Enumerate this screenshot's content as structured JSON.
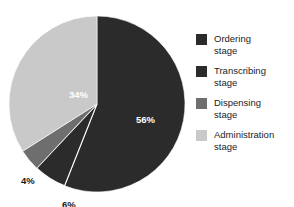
{
  "chart_data": {
    "type": "pie",
    "title": "",
    "subtitle": "",
    "xlabel": "",
    "ylabel": "",
    "grid": false,
    "legend_position": "right",
    "start_angle_deg": 0,
    "direction": "clockwise",
    "categories": [
      "Ordering stage",
      "Transcribing stage",
      "Dispensing stage",
      "Administration stage"
    ],
    "values": [
      56,
      6,
      4,
      34
    ],
    "value_unit": "%",
    "data_labels": [
      "56%",
      "6%",
      "4%",
      "34%"
    ],
    "colors": [
      "#2b2b2b",
      "#2b2b2b",
      "#6e6e6e",
      "#c9c9c9"
    ],
    "slices": [
      {
        "label": "Ordering stage",
        "value": 56,
        "data_label": "56%",
        "color": "#2b2b2b",
        "label_placement": "inside",
        "label_color": "#ffffff"
      },
      {
        "label": "Transcribing stage",
        "value": 6,
        "data_label": "6%",
        "color": "#2b2b2b",
        "label_placement": "outside",
        "label_color": "#1a1a1a"
      },
      {
        "label": "Dispensing stage",
        "value": 4,
        "data_label": "4%",
        "color": "#6e6e6e",
        "label_placement": "outside",
        "label_color": "#1a1a1a"
      },
      {
        "label": "Administration stage",
        "value": 34,
        "data_label": "34%",
        "color": "#c9c9c9",
        "label_placement": "inside",
        "label_color": "#1a1a1a"
      }
    ]
  },
  "legend": {
    "items": [
      {
        "label_line1": "Ordering",
        "label_line2": "stage",
        "color": "#2b2b2b"
      },
      {
        "label_line1": "Transcribing",
        "label_line2": "stage",
        "color": "#2b2b2b"
      },
      {
        "label_line1": "Dispensing",
        "label_line2": "stage",
        "color": "#6e6e6e"
      },
      {
        "label_line1": "Administration",
        "label_line2": "stage",
        "color": "#c9c9c9"
      }
    ]
  }
}
